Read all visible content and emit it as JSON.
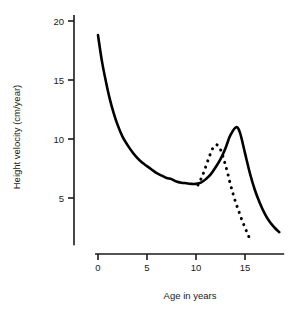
{
  "chart_data": {
    "type": "line",
    "title": "",
    "xlabel": "Age in years",
    "ylabel": "Height velocity (cm/year)",
    "xlim": [
      -0.3,
      19.0
    ],
    "ylim": [
      1.0,
      20.5
    ],
    "xticks": [
      0,
      5,
      10,
      15
    ],
    "xtick_labels": [
      "0",
      "5",
      "10",
      "15"
    ],
    "yticks": [
      5,
      10,
      15,
      20
    ],
    "ytick_labels": [
      "5",
      "10",
      "15",
      "20"
    ],
    "grid": false,
    "legend": "none",
    "series": [
      {
        "name": "average maturer",
        "style": "solid",
        "color": "#000000",
        "points": [
          [
            0.0,
            18.8
          ],
          [
            0.4,
            16.6
          ],
          [
            0.8,
            14.9
          ],
          [
            1.2,
            13.4
          ],
          [
            1.6,
            12.2
          ],
          [
            2.0,
            11.2
          ],
          [
            2.5,
            10.2
          ],
          [
            3.0,
            9.5
          ],
          [
            3.5,
            8.9
          ],
          [
            4.0,
            8.4
          ],
          [
            4.5,
            8.0
          ],
          [
            5.0,
            7.7
          ],
          [
            5.5,
            7.4
          ],
          [
            6.0,
            7.1
          ],
          [
            6.5,
            6.9
          ],
          [
            7.0,
            6.7
          ],
          [
            7.5,
            6.6
          ],
          [
            8.0,
            6.4
          ],
          [
            8.5,
            6.3
          ],
          [
            9.0,
            6.25
          ],
          [
            9.5,
            6.2
          ],
          [
            10.0,
            6.2
          ],
          [
            10.5,
            6.3
          ],
          [
            11.0,
            6.6
          ],
          [
            11.5,
            7.0
          ],
          [
            12.0,
            7.6
          ],
          [
            12.5,
            8.3
          ],
          [
            13.0,
            9.2
          ],
          [
            13.5,
            10.3
          ],
          [
            14.1,
            11.0
          ],
          [
            14.5,
            10.5
          ],
          [
            15.0,
            8.8
          ],
          [
            15.5,
            7.1
          ],
          [
            16.0,
            5.7
          ],
          [
            16.5,
            4.6
          ],
          [
            17.0,
            3.7
          ],
          [
            17.5,
            3.0
          ],
          [
            18.0,
            2.5
          ],
          [
            18.5,
            2.1
          ]
        ]
      },
      {
        "name": "early maturer",
        "style": "dotted",
        "color": "#000000",
        "points": [
          [
            10.2,
            6.1
          ],
          [
            10.5,
            6.6
          ],
          [
            10.8,
            7.2
          ],
          [
            11.1,
            7.9
          ],
          [
            11.4,
            8.6
          ],
          [
            11.7,
            9.2
          ],
          [
            12.0,
            9.5
          ],
          [
            12.3,
            9.4
          ],
          [
            12.6,
            8.9
          ],
          [
            12.9,
            8.1
          ],
          [
            13.2,
            7.2
          ],
          [
            13.5,
            6.2
          ],
          [
            13.8,
            5.3
          ],
          [
            14.1,
            4.5
          ],
          [
            14.4,
            3.8
          ],
          [
            14.7,
            3.1
          ],
          [
            15.0,
            2.5
          ],
          [
            15.3,
            1.9
          ],
          [
            15.6,
            1.35
          ]
        ]
      }
    ],
    "annotations": []
  },
  "axis": {
    "x_title": "Age in years",
    "y_title": "Height velocity (cm/year)"
  }
}
